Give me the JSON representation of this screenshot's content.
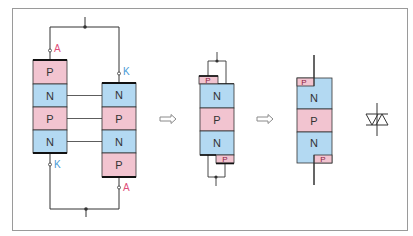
{
  "colors": {
    "p_fill": "#f2c4d0",
    "n_fill": "#b3d9f2",
    "outline": "#333333",
    "wire": "#333333",
    "anode_label": "#e0507a",
    "cathode_label": "#4a9bd6",
    "frame": "#9a9a9a",
    "arrow_stroke": "#8a8a8a"
  },
  "left_scr": {
    "layers": [
      "P",
      "N",
      "P",
      "N"
    ],
    "top_terminal": "A",
    "bottom_terminal": "K"
  },
  "right_scr": {
    "layers": [
      "N",
      "P",
      "N",
      "P"
    ],
    "top_terminal": "K",
    "bottom_terminal": "A"
  },
  "merged_structure": {
    "layers": [
      "N",
      "P",
      "N"
    ],
    "top_small_layer": "P",
    "bottom_small_layer": "P"
  },
  "triac_structure": {
    "layers": [
      "N",
      "P",
      "N"
    ],
    "top_small_layer": "P",
    "bottom_small_layer": "P"
  },
  "arrows": [
    "double-arrow-right",
    "double-arrow-right"
  ],
  "symbol": "triac-symbol"
}
